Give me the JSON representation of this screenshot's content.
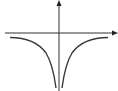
{
  "diagram": {
    "axes": {
      "x_axis": {
        "arrow": true,
        "y_px": 33
      },
      "y_axis": {
        "arrow": true,
        "x_px": 59
      }
    },
    "colors": {
      "axis": "#333333",
      "curve": "#3a3a3a",
      "background": "#ffffff"
    }
  }
}
